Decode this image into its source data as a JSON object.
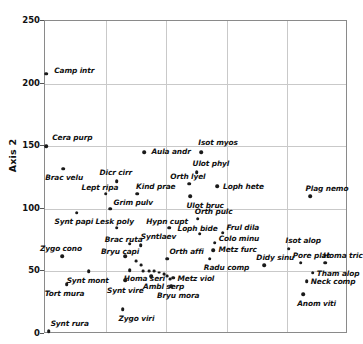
{
  "chart_data": {
    "type": "scatter",
    "title": "",
    "xlabel": "",
    "ylabel": "Axis 2",
    "ylim": [
      0,
      250
    ],
    "yticks": [
      0,
      50,
      100,
      150,
      200,
      250
    ],
    "xlim": [
      0,
      5
    ],
    "grid": true,
    "legend": false,
    "n_vertical_gridlines": 4,
    "points": [
      {
        "label": "Camp intr",
        "px": 0.02,
        "py": 208,
        "lx": 8,
        "ly": -4
      },
      {
        "label": "Cera purp",
        "px": 0.02,
        "py": 150,
        "lx": 6,
        "ly": -9
      },
      {
        "label": "Brac velu",
        "px": 0.3,
        "py": 132,
        "lx": -18,
        "ly": 8
      },
      {
        "label": "Aula andr",
        "px": 1.64,
        "py": 145,
        "lx": 7,
        "ly": -1
      },
      {
        "label": "Isot myos",
        "px": 2.58,
        "py": 145,
        "lx": -3,
        "ly": -10
      },
      {
        "label": "Ulot phyl",
        "px": 2.5,
        "py": 129,
        "lx": -4,
        "ly": -9
      },
      {
        "label": "Dicr cirr",
        "px": 1.18,
        "py": 122,
        "lx": -17,
        "ly": -9
      },
      {
        "label": "Orth lyel",
        "px": 2.38,
        "py": 120,
        "lx": -19,
        "ly": -8
      },
      {
        "label": "Loph hete",
        "px": 2.84,
        "py": 118,
        "lx": 6,
        "ly": 0
      },
      {
        "label": "Lept ripa",
        "px": 1.0,
        "py": 112,
        "lx": -24,
        "ly": -7
      },
      {
        "label": "Kind prae",
        "px": 1.52,
        "py": 112,
        "lx": -1,
        "ly": -8
      },
      {
        "label": "Ulot bruc",
        "px": 2.4,
        "py": 110,
        "lx": -4,
        "ly": 9
      },
      {
        "label": "Plag nemo",
        "px": 4.38,
        "py": 110,
        "lx": -5,
        "ly": -8
      },
      {
        "label": "Grim pulv",
        "px": 1.08,
        "py": 100,
        "lx": 3,
        "ly": -7
      },
      {
        "label": "Synt papi",
        "px": 0.52,
        "py": 97,
        "lx": -22,
        "ly": 8
      },
      {
        "label": "Orth pulc",
        "px": 2.52,
        "py": 92,
        "lx": -3,
        "ly": -8
      },
      {
        "label": "Hypn cupt",
        "px": 2.05,
        "py": 85,
        "lx": -23,
        "ly": -7
      },
      {
        "label": "Lesk poly",
        "px": 1.18,
        "py": 85,
        "lx": -21,
        "ly": -7
      },
      {
        "label": "Loph bide",
        "px": 2.55,
        "py": 80,
        "lx": -22,
        "ly": -6
      },
      {
        "label": "Frul dila",
        "px": 2.93,
        "py": 81,
        "lx": 4,
        "ly": -6
      },
      {
        "label": "Colo minu",
        "px": 2.8,
        "py": 73,
        "lx": 4,
        "ly": -5
      },
      {
        "label": "Metz furc",
        "px": 2.78,
        "py": 67,
        "lx": 5,
        "ly": -1
      },
      {
        "label": "Isot alop",
        "px": 4.02,
        "py": 68,
        "lx": -3,
        "ly": -9
      },
      {
        "label": "Brac ruta",
        "px": 1.4,
        "py": 72,
        "lx": -25,
        "ly": -5
      },
      {
        "label": "Syntlaev",
        "px": 1.58,
        "py": 71,
        "lx": 0,
        "ly": -9
      },
      {
        "label": "Zygo cono",
        "px": 0.28,
        "py": 62,
        "lx": -22,
        "ly": -8
      },
      {
        "label": "Bryu capi",
        "px": 1.32,
        "py": 62,
        "lx": -24,
        "ly": -5
      },
      {
        "label": "Orth affi",
        "px": 2.02,
        "py": 60,
        "lx": 2,
        "ly": -8
      },
      {
        "label": "Radu comp",
        "px": 2.72,
        "py": 60,
        "lx": -6,
        "ly": 8
      },
      {
        "label": "Pore plat",
        "px": 4.22,
        "py": 57,
        "lx": -8,
        "ly": -8
      },
      {
        "label": "Homa tric",
        "px": 4.62,
        "py": 57,
        "lx": -2,
        "ly": -8
      },
      {
        "label": "Didy sinu",
        "px": 3.62,
        "py": 55,
        "lx": -8,
        "ly": -8
      },
      {
        "label": "Tham alop",
        "px": 4.42,
        "py": 49,
        "lx": 4,
        "ly": 0
      },
      {
        "label": "Homa seri",
        "px": 1.4,
        "py": 51,
        "lx": -6,
        "ly": 8
      },
      {
        "label": "Synt mont",
        "px": 0.72,
        "py": 50,
        "lx": -22,
        "ly": 9
      },
      {
        "label": "Ambl serp",
        "px": 1.75,
        "py": 46,
        "lx": -8,
        "ly": 10
      },
      {
        "label": "Metz viol",
        "px": 2.12,
        "py": 45,
        "lx": 4,
        "ly": 0
      },
      {
        "label": "Neck comp",
        "px": 4.32,
        "py": 42,
        "lx": 4,
        "ly": 0
      },
      {
        "label": "Synt vire",
        "px": 1.32,
        "py": 43,
        "lx": -18,
        "ly": 10
      },
      {
        "label": "Bryu mora",
        "px": 2.08,
        "py": 38,
        "lx": -14,
        "ly": 9
      },
      {
        "label": "Tort mura",
        "px": 0.36,
        "py": 40,
        "lx": -22,
        "ly": 9
      },
      {
        "label": "Anom viti",
        "px": 4.26,
        "py": 32,
        "lx": -6,
        "ly": 9
      },
      {
        "label": "Zygo viri",
        "px": 1.28,
        "py": 20,
        "lx": -4,
        "ly": 9
      },
      {
        "label": "Synt rura",
        "px": 0.06,
        "py": 2,
        "lx": 2,
        "ly": -8
      }
    ],
    "extra_points": [
      {
        "px": 1.5,
        "py": 58,
        "small": true
      },
      {
        "px": 1.58,
        "py": 55,
        "small": true
      },
      {
        "px": 1.62,
        "py": 50,
        "small": true
      },
      {
        "px": 1.72,
        "py": 50,
        "small": true
      },
      {
        "px": 1.8,
        "py": 50,
        "small": true
      },
      {
        "px": 1.88,
        "py": 49,
        "small": true
      },
      {
        "px": 1.96,
        "py": 48,
        "small": true
      },
      {
        "px": 2.02,
        "py": 46,
        "small": true
      },
      {
        "px": 2.06,
        "py": 44,
        "small": true
      }
    ]
  }
}
